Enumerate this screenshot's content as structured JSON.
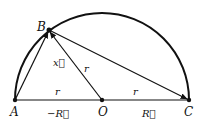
{
  "diagram": {
    "points": {
      "A": {
        "label": "A"
      },
      "B": {
        "label": "B"
      },
      "O": {
        "label": "O"
      },
      "C": {
        "label": "C"
      }
    },
    "labels": {
      "x_vec": "x⃗",
      "r_AO": "r",
      "r_OB": "r",
      "r_OC": "r",
      "neg_R": "−R⃗",
      "R": "R⃗"
    },
    "colors": {
      "stroke": "#111111",
      "background": "#ffffff"
    }
  }
}
